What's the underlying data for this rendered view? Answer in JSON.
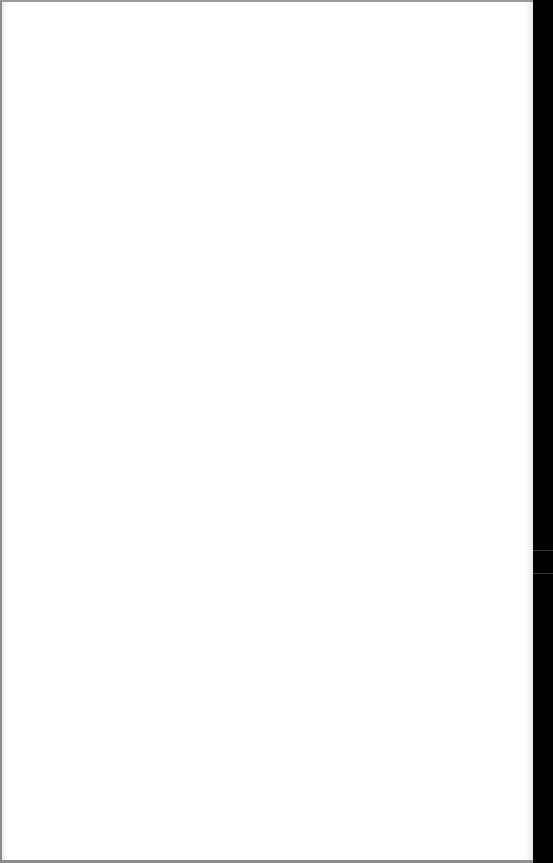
{
  "page": {
    "content": "",
    "background_color": "#ffffff",
    "border_color": "#8a8a8a"
  },
  "side_strip": {
    "background_color": "#000000",
    "separator_color": "#3a3a3a",
    "separator_positions_px": [
      550,
      573
    ]
  }
}
